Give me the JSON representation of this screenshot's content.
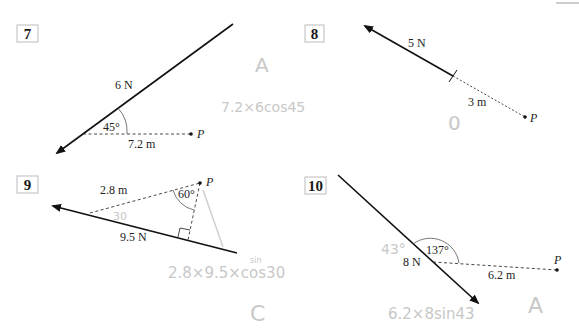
{
  "questions": [
    {
      "number": "7",
      "force_label": "6 N",
      "angle_label": "45°",
      "distance_label": "7.2 m",
      "point_label": "P",
      "annotations": {
        "answer": "A",
        "working": "7.2×6cos45"
      }
    },
    {
      "number": "8",
      "force_label": "5 N",
      "distance_label": "3 m",
      "point_label": "P",
      "annotations": {
        "answer": "0"
      }
    },
    {
      "number": "9",
      "force_label": "9.5 N",
      "angle_label": "60°",
      "distance_label": "2.8 m",
      "point_label": "P",
      "annotations": {
        "angle": "30",
        "answer": "C",
        "working": "2.8×9.5×cos30",
        "correction": "sin"
      }
    },
    {
      "number": "10",
      "force_label": "8 N",
      "angle_label": "137°",
      "distance_label": "6.2 m",
      "point_label": "P",
      "annotations": {
        "angle": "43°",
        "answer": "A",
        "working": "6.2×8sin43"
      }
    }
  ],
  "colors": {
    "ink": "#1a1a1a",
    "pencil": "#c8c8c8",
    "box_border": "#bbbbbb"
  }
}
